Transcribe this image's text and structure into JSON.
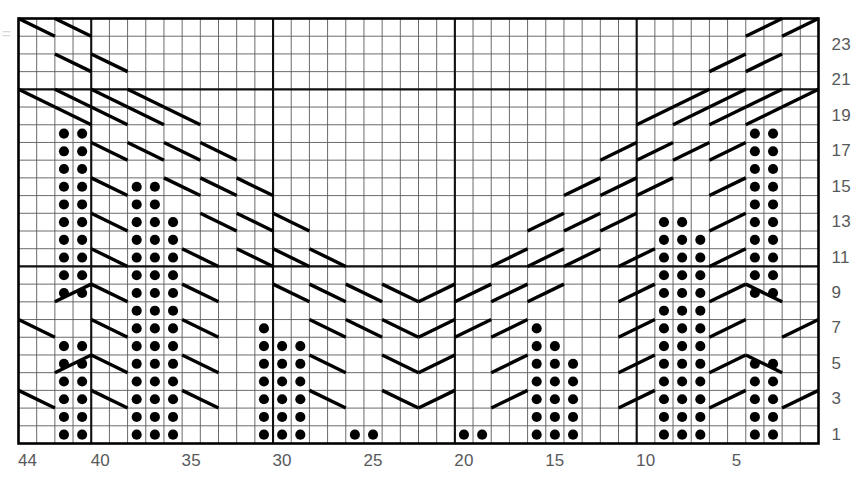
{
  "chart_data": {
    "type": "table",
    "grid": {
      "columns": 44,
      "rows": 24,
      "column_order": "right-to-left",
      "row_order": "bottom-to-top",
      "grid": true
    },
    "xlabel": "Stitch number",
    "ylabel": "Row number",
    "x_tick_labels": [
      "44",
      "40",
      "35",
      "30",
      "25",
      "20",
      "15",
      "10",
      "5"
    ],
    "x_tick_columns": [
      44,
      40,
      35,
      30,
      25,
      20,
      15,
      10,
      5
    ],
    "y_tick_labels": [
      "1",
      "3",
      "5",
      "7",
      "9",
      "11",
      "13",
      "15",
      "17",
      "19",
      "21",
      "23"
    ],
    "y_tick_rows": [
      1,
      3,
      5,
      7,
      9,
      11,
      13,
      15,
      17,
      19,
      21,
      23
    ],
    "heavy_column_boundaries": [
      10,
      20,
      30,
      40
    ],
    "heavy_row_boundaries": [
      10,
      20
    ],
    "symbols": {
      "dot": {
        "name": "purl-stitch-dot",
        "color": "#000000"
      },
      "diagonal_down": {
        "name": "cable-cross-right-leaning",
        "color": "#000000"
      },
      "diagonal_up": {
        "name": "cable-cross-left-leaning",
        "color": "#000000"
      }
    },
    "colors": {
      "grid_light": "#5a5a5a",
      "grid_heavy": "#111111",
      "border": "#000000",
      "symbol": "#000000",
      "label_text": "#58595b",
      "background": "#ffffff"
    },
    "dot_cells": [
      {
        "row": 1,
        "cols": [
          42,
          41,
          38,
          37,
          36,
          31,
          30,
          29,
          26,
          25,
          20,
          19,
          16,
          15,
          14,
          9,
          8,
          7,
          4,
          3
        ]
      },
      {
        "row": 2,
        "cols": [
          42,
          41,
          38,
          37,
          36,
          31,
          30,
          29,
          16,
          15,
          14,
          9,
          8,
          7,
          4,
          3
        ]
      },
      {
        "row": 3,
        "cols": [
          42,
          41,
          38,
          37,
          36,
          31,
          30,
          29,
          16,
          15,
          14,
          9,
          8,
          7,
          4,
          3
        ]
      },
      {
        "row": 4,
        "cols": [
          42,
          41,
          38,
          37,
          36,
          31,
          30,
          29,
          16,
          15,
          14,
          9,
          8,
          7,
          4,
          3
        ]
      },
      {
        "row": 5,
        "cols": [
          42,
          41,
          38,
          37,
          36,
          31,
          30,
          29,
          16,
          15,
          14,
          9,
          8,
          7,
          4,
          3
        ]
      },
      {
        "row": 6,
        "cols": [
          42,
          41,
          38,
          37,
          36,
          31,
          30,
          29,
          16,
          15,
          9,
          8,
          7
        ]
      },
      {
        "row": 7,
        "cols": [
          38,
          37,
          36,
          31,
          16,
          9,
          8,
          7
        ]
      },
      {
        "row": 8,
        "cols": [
          38,
          37,
          36,
          9,
          8,
          7
        ]
      },
      {
        "row": 9,
        "cols": [
          42,
          41,
          38,
          37,
          36,
          9,
          8,
          7,
          4,
          3
        ]
      },
      {
        "row": 10,
        "cols": [
          42,
          41,
          38,
          37,
          36,
          9,
          8,
          7,
          4,
          3
        ]
      },
      {
        "row": 11,
        "cols": [
          42,
          41,
          38,
          37,
          36,
          9,
          8,
          7,
          4,
          3
        ]
      },
      {
        "row": 12,
        "cols": [
          42,
          41,
          38,
          37,
          36,
          9,
          8,
          7,
          4,
          3
        ]
      },
      {
        "row": 13,
        "cols": [
          42,
          41,
          38,
          37,
          36,
          9,
          8,
          4,
          3
        ]
      },
      {
        "row": 14,
        "cols": [
          42,
          41,
          38,
          37,
          4,
          3
        ]
      },
      {
        "row": 15,
        "cols": [
          42,
          41,
          38,
          37,
          4,
          3
        ]
      },
      {
        "row": 16,
        "cols": [
          42,
          41,
          4,
          3
        ]
      },
      {
        "row": 17,
        "cols": [
          42,
          41,
          4,
          3
        ]
      },
      {
        "row": 18,
        "cols": [
          42,
          41,
          4,
          3
        ]
      },
      {
        "row": 19,
        "cols": []
      },
      {
        "row": 20,
        "cols": []
      },
      {
        "row": 21,
        "cols": []
      },
      {
        "row": 22,
        "cols": []
      },
      {
        "row": 23,
        "cols": []
      },
      {
        "row": 24,
        "cols": []
      }
    ],
    "cable_strokes": [
      {
        "row": 24,
        "col_start": 44,
        "col_end": 43,
        "dir": "down"
      },
      {
        "row": 24,
        "col_start": 42,
        "col_end": 41,
        "dir": "down"
      },
      {
        "row": 24,
        "col_start": 3,
        "col_end": 4,
        "dir": "up"
      },
      {
        "row": 24,
        "col_start": 1,
        "col_end": 2,
        "dir": "up"
      },
      {
        "row": 22,
        "col_start": 42,
        "col_end": 41,
        "dir": "down"
      },
      {
        "row": 22,
        "col_start": 40,
        "col_end": 39,
        "dir": "down"
      },
      {
        "row": 22,
        "col_start": 3,
        "col_end": 4,
        "dir": "up"
      },
      {
        "row": 22,
        "col_start": 5,
        "col_end": 6,
        "dir": "up"
      },
      {
        "row": 20,
        "col_start": 44,
        "col_end": 43,
        "dir": "down"
      },
      {
        "row": 20,
        "col_start": 42,
        "col_end": 41,
        "dir": "down"
      },
      {
        "row": 20,
        "col_start": 40,
        "col_end": 39,
        "dir": "down"
      },
      {
        "row": 20,
        "col_start": 38,
        "col_end": 37,
        "dir": "down"
      },
      {
        "row": 20,
        "col_start": 1,
        "col_end": 2,
        "dir": "up"
      },
      {
        "row": 20,
        "col_start": 3,
        "col_end": 4,
        "dir": "up"
      },
      {
        "row": 20,
        "col_start": 5,
        "col_end": 6,
        "dir": "up"
      },
      {
        "row": 20,
        "col_start": 7,
        "col_end": 8,
        "dir": "up"
      },
      {
        "row": 19,
        "col_start": 42,
        "col_end": 41,
        "dir": "down"
      },
      {
        "row": 19,
        "col_start": 40,
        "col_end": 39,
        "dir": "down"
      },
      {
        "row": 19,
        "col_start": 38,
        "col_end": 37,
        "dir": "down"
      },
      {
        "row": 19,
        "col_start": 36,
        "col_end": 35,
        "dir": "down"
      },
      {
        "row": 19,
        "col_start": 3,
        "col_end": 4,
        "dir": "up"
      },
      {
        "row": 19,
        "col_start": 5,
        "col_end": 6,
        "dir": "up"
      },
      {
        "row": 19,
        "col_start": 7,
        "col_end": 8,
        "dir": "up"
      },
      {
        "row": 19,
        "col_start": 9,
        "col_end": 10,
        "dir": "up"
      },
      {
        "row": 17,
        "col_start": 40,
        "col_end": 39,
        "dir": "down"
      },
      {
        "row": 17,
        "col_start": 38,
        "col_end": 37,
        "dir": "down"
      },
      {
        "row": 17,
        "col_start": 36,
        "col_end": 35,
        "dir": "down"
      },
      {
        "row": 17,
        "col_start": 34,
        "col_end": 33,
        "dir": "down"
      },
      {
        "row": 17,
        "col_start": 5,
        "col_end": 6,
        "dir": "up"
      },
      {
        "row": 17,
        "col_start": 7,
        "col_end": 8,
        "dir": "up"
      },
      {
        "row": 17,
        "col_start": 9,
        "col_end": 10,
        "dir": "up"
      },
      {
        "row": 17,
        "col_start": 11,
        "col_end": 12,
        "dir": "up"
      },
      {
        "row": 15,
        "col_start": 40,
        "col_end": 39,
        "dir": "down"
      },
      {
        "row": 15,
        "col_start": 36,
        "col_end": 35,
        "dir": "down"
      },
      {
        "row": 15,
        "col_start": 34,
        "col_end": 33,
        "dir": "down"
      },
      {
        "row": 15,
        "col_start": 32,
        "col_end": 31,
        "dir": "down"
      },
      {
        "row": 15,
        "col_start": 5,
        "col_end": 6,
        "dir": "up"
      },
      {
        "row": 15,
        "col_start": 9,
        "col_end": 10,
        "dir": "up"
      },
      {
        "row": 15,
        "col_start": 11,
        "col_end": 12,
        "dir": "up"
      },
      {
        "row": 15,
        "col_start": 13,
        "col_end": 14,
        "dir": "up"
      },
      {
        "row": 13,
        "col_start": 40,
        "col_end": 39,
        "dir": "down"
      },
      {
        "row": 13,
        "col_start": 34,
        "col_end": 33,
        "dir": "down"
      },
      {
        "row": 13,
        "col_start": 32,
        "col_end": 31,
        "dir": "down"
      },
      {
        "row": 13,
        "col_start": 30,
        "col_end": 29,
        "dir": "down"
      },
      {
        "row": 13,
        "col_start": 5,
        "col_end": 6,
        "dir": "up"
      },
      {
        "row": 13,
        "col_start": 11,
        "col_end": 12,
        "dir": "up"
      },
      {
        "row": 13,
        "col_start": 13,
        "col_end": 14,
        "dir": "up"
      },
      {
        "row": 13,
        "col_start": 15,
        "col_end": 16,
        "dir": "up"
      },
      {
        "row": 11,
        "col_start": 40,
        "col_end": 39,
        "dir": "down"
      },
      {
        "row": 11,
        "col_start": 35,
        "col_end": 34,
        "dir": "down"
      },
      {
        "row": 11,
        "col_start": 32,
        "col_end": 31,
        "dir": "down"
      },
      {
        "row": 11,
        "col_start": 30,
        "col_end": 29,
        "dir": "down"
      },
      {
        "row": 11,
        "col_start": 28,
        "col_end": 27,
        "dir": "down"
      },
      {
        "row": 11,
        "col_start": 5,
        "col_end": 6,
        "dir": "up"
      },
      {
        "row": 11,
        "col_start": 10,
        "col_end": 11,
        "dir": "up"
      },
      {
        "row": 11,
        "col_start": 13,
        "col_end": 14,
        "dir": "up"
      },
      {
        "row": 11,
        "col_start": 15,
        "col_end": 16,
        "dir": "up"
      },
      {
        "row": 11,
        "col_start": 17,
        "col_end": 18,
        "dir": "up"
      },
      {
        "row": 9,
        "col_start": 42,
        "col_end": 41,
        "dir": "up"
      },
      {
        "row": 9,
        "col_start": 40,
        "col_end": 39,
        "dir": "down"
      },
      {
        "row": 9,
        "col_start": 35,
        "col_end": 34,
        "dir": "down"
      },
      {
        "row": 9,
        "col_start": 30,
        "col_end": 29,
        "dir": "down"
      },
      {
        "row": 9,
        "col_start": 28,
        "col_end": 27,
        "dir": "down"
      },
      {
        "row": 9,
        "col_start": 26,
        "col_end": 25,
        "dir": "down"
      },
      {
        "row": 9,
        "col_start": 24,
        "col_end": 23,
        "dir": "down"
      },
      {
        "row": 9,
        "col_start": 21,
        "col_end": 22,
        "dir": "up"
      },
      {
        "row": 9,
        "col_start": 19,
        "col_end": 20,
        "dir": "up"
      },
      {
        "row": 9,
        "col_start": 17,
        "col_end": 18,
        "dir": "up"
      },
      {
        "row": 9,
        "col_start": 15,
        "col_end": 16,
        "dir": "up"
      },
      {
        "row": 9,
        "col_start": 10,
        "col_end": 11,
        "dir": "up"
      },
      {
        "row": 9,
        "col_start": 5,
        "col_end": 6,
        "dir": "up"
      },
      {
        "row": 9,
        "col_start": 4,
        "col_end": 3,
        "dir": "down"
      },
      {
        "row": 7,
        "col_start": 44,
        "col_end": 43,
        "dir": "down"
      },
      {
        "row": 7,
        "col_start": 40,
        "col_end": 39,
        "dir": "down"
      },
      {
        "row": 7,
        "col_start": 35,
        "col_end": 34,
        "dir": "down"
      },
      {
        "row": 7,
        "col_start": 28,
        "col_end": 27,
        "dir": "down"
      },
      {
        "row": 7,
        "col_start": 26,
        "col_end": 25,
        "dir": "down"
      },
      {
        "row": 7,
        "col_start": 24,
        "col_end": 23,
        "dir": "down"
      },
      {
        "row": 7,
        "col_start": 21,
        "col_end": 22,
        "dir": "up"
      },
      {
        "row": 7,
        "col_start": 19,
        "col_end": 20,
        "dir": "up"
      },
      {
        "row": 7,
        "col_start": 17,
        "col_end": 18,
        "dir": "up"
      },
      {
        "row": 7,
        "col_start": 10,
        "col_end": 11,
        "dir": "up"
      },
      {
        "row": 7,
        "col_start": 5,
        "col_end": 6,
        "dir": "up"
      },
      {
        "row": 7,
        "col_start": 1,
        "col_end": 2,
        "dir": "up"
      },
      {
        "row": 5,
        "col_start": 42,
        "col_end": 41,
        "dir": "up"
      },
      {
        "row": 5,
        "col_start": 40,
        "col_end": 39,
        "dir": "down"
      },
      {
        "row": 5,
        "col_start": 35,
        "col_end": 34,
        "dir": "down"
      },
      {
        "row": 5,
        "col_start": 28,
        "col_end": 27,
        "dir": "down"
      },
      {
        "row": 5,
        "col_start": 24,
        "col_end": 23,
        "dir": "down"
      },
      {
        "row": 5,
        "col_start": 21,
        "col_end": 22,
        "dir": "up"
      },
      {
        "row": 5,
        "col_start": 17,
        "col_end": 18,
        "dir": "up"
      },
      {
        "row": 5,
        "col_start": 10,
        "col_end": 11,
        "dir": "up"
      },
      {
        "row": 5,
        "col_start": 5,
        "col_end": 6,
        "dir": "up"
      },
      {
        "row": 5,
        "col_start": 4,
        "col_end": 3,
        "dir": "down"
      },
      {
        "row": 3,
        "col_start": 44,
        "col_end": 43,
        "dir": "down"
      },
      {
        "row": 3,
        "col_start": 40,
        "col_end": 39,
        "dir": "down"
      },
      {
        "row": 3,
        "col_start": 35,
        "col_end": 34,
        "dir": "down"
      },
      {
        "row": 3,
        "col_start": 28,
        "col_end": 27,
        "dir": "down"
      },
      {
        "row": 3,
        "col_start": 24,
        "col_end": 23,
        "dir": "down"
      },
      {
        "row": 3,
        "col_start": 21,
        "col_end": 22,
        "dir": "up"
      },
      {
        "row": 3,
        "col_start": 17,
        "col_end": 18,
        "dir": "up"
      },
      {
        "row": 3,
        "col_start": 10,
        "col_end": 11,
        "dir": "up"
      },
      {
        "row": 3,
        "col_start": 5,
        "col_end": 6,
        "dir": "up"
      },
      {
        "row": 3,
        "col_start": 1,
        "col_end": 2,
        "dir": "up"
      }
    ]
  }
}
